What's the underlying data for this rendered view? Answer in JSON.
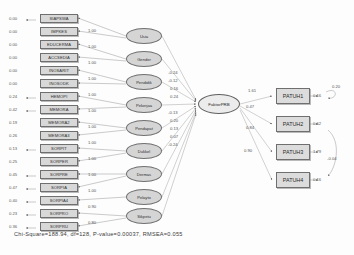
{
  "diagram": {
    "type": "sem-path-diagram",
    "core_factor": {
      "label": "FaktorPRB",
      "x": 198,
      "y": 104,
      "w": 42,
      "h": 20
    },
    "observed_boxes": [
      {
        "label": "SIAPSWA",
        "error": "0.00",
        "loading": "1.00",
        "x": 40,
        "y": 14
      },
      {
        "label": "IMPKES",
        "error": "0.00",
        "loading": "1.00",
        "x": 40,
        "y": 27
      },
      {
        "label": "EDUCERMA",
        "error": "0.00",
        "loading": "1.00",
        "x": 40,
        "y": 40
      },
      {
        "label": "ACCSEDIA",
        "error": "0.00",
        "loading": "1.00",
        "x": 40,
        "y": 53
      },
      {
        "label": "INOSARIT",
        "error": "0.00",
        "loading": "1.00",
        "x": 40,
        "y": 66
      },
      {
        "label": "INOSODK",
        "error": "0.00",
        "loading": "1.00",
        "x": 40,
        "y": 79
      },
      {
        "label": "HEMOPI",
        "error": "0.24",
        "loading": "1.00",
        "x": 40,
        "y": 92
      },
      {
        "label": "MEMORA",
        "error": "0.42",
        "loading": "1.00",
        "x": 40,
        "y": 105
      },
      {
        "label": "MEMORA2",
        "error": "0.19",
        "loading": "1.00",
        "x": 40,
        "y": 118
      },
      {
        "label": "MEMORA3",
        "error": "0.26",
        "loading": "1.00",
        "x": 40,
        "y": 131
      },
      {
        "label": "SORPIT",
        "error": "0.13",
        "loading": "1.00",
        "x": 40,
        "y": 144
      },
      {
        "label": "SORPER",
        "error": "0.25",
        "loading": "1.00",
        "x": 40,
        "y": 157
      },
      {
        "label": "SORPRE",
        "error": "0.45",
        "loading": "1.00",
        "x": 40,
        "y": 170
      },
      {
        "label": "SORPIA",
        "error": "0.47",
        "loading": "1.00",
        "x": 40,
        "y": 183
      },
      {
        "label": "SORPIA4",
        "error": "0.40",
        "loading": "1.00",
        "x": 40,
        "y": 196
      },
      {
        "label": "SORPRO",
        "error": "0.23",
        "loading": "0.90",
        "x": 40,
        "y": 209
      },
      {
        "label": "SORPRU",
        "error": "0.36",
        "loading": "0.80",
        "x": 40,
        "y": 222
      }
    ],
    "latent_ellipses": [
      {
        "label": "Usia",
        "path": "-0.24",
        "x": 134,
        "y": 33
      },
      {
        "label": "Gender",
        "path": "-0.12",
        "x": 134,
        "y": 56
      },
      {
        "label": "Pendidik",
        "path": "0.16",
        "x": 134,
        "y": 79
      },
      {
        "label": "Pekerjaa",
        "path": "0.24",
        "x": 134,
        "y": 102
      },
      {
        "label": "Pendapat",
        "path": "-0.13",
        "x": 134,
        "y": 125
      },
      {
        "label": "Dukkel",
        "path": "0.20",
        "x": 134,
        "y": 148
      },
      {
        "label": "Dermas",
        "path": "0.13",
        "x": 134,
        "y": 171
      },
      {
        "label": "Pelayto",
        "path": "0.07",
        "x": 134,
        "y": 194
      },
      {
        "label": "Sikpetu",
        "path": "-0.24",
        "x": 134,
        "y": 213
      }
    ],
    "patuh_boxes": [
      {
        "label": "PATUH1",
        "loading": "1.00",
        "error": "0.16",
        "x": 276,
        "y": 90
      },
      {
        "label": "PATUH2",
        "loading": "0.62",
        "error": "0.62",
        "x": 276,
        "y": 118
      },
      {
        "label": "PATUH3",
        "loading": "0.47",
        "error": "1.79",
        "x": 276,
        "y": 146
      },
      {
        "label": "PATUH4",
        "loading": "0.84",
        "error": "0.16",
        "x": 276,
        "y": 174
      }
    ],
    "core_to_patuh": [
      "1.61",
      "0.47",
      "0.84",
      "0.90"
    ],
    "correlations": [
      {
        "value": "0.20",
        "x": 332,
        "y": 88
      },
      {
        "value": "-0.04",
        "x": 330,
        "y": 160
      }
    ],
    "footer": "Chi-Square=188.94, df=128, P-value=0.00037, RMSEA=0.055"
  }
}
